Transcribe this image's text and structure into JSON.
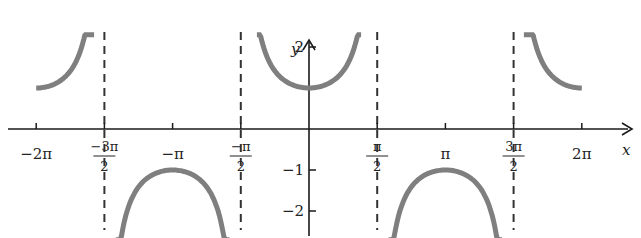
{
  "chart_data": {
    "type": "line",
    "title": "",
    "function": "y = sec x",
    "xlabel": "x",
    "ylabel": "y",
    "xlim": [
      -6.6,
      6.9
    ],
    "ylim": [
      -2.6,
      2.0
    ],
    "grid": false,
    "legend": null,
    "x_ticks": [
      {
        "value": -6.2832,
        "label": "−2π"
      },
      {
        "value": -4.7124,
        "label": "−3π/2",
        "num": "−3π",
        "den": "2"
      },
      {
        "value": -3.1416,
        "label": "−π"
      },
      {
        "value": -1.5708,
        "label": "−π/2",
        "num": "−π",
        "den": "2"
      },
      {
        "value": 1.5708,
        "label": "π/2",
        "num": "π",
        "den": "2"
      },
      {
        "value": 3.1416,
        "label": "π"
      },
      {
        "value": 4.7124,
        "label": "3π/2",
        "num": "3π",
        "den": "2"
      },
      {
        "value": 6.2832,
        "label": "2π"
      }
    ],
    "y_ticks": [
      {
        "value": 2,
        "label": "2"
      },
      {
        "value": -1,
        "label": "−1"
      },
      {
        "value": -2,
        "label": "−2"
      }
    ],
    "asymptotes": [
      -4.7124,
      -1.5708,
      1.5708,
      4.7124
    ],
    "series": [
      {
        "name": "sec x branch 1",
        "x_range": [
          -6.2832,
          -4.95
        ],
        "points": [
          [
            -6.2832,
            1
          ],
          [
            -5.5,
            1.41
          ],
          [
            -5.2,
            2.1
          ],
          [
            -4.95,
            4.2
          ]
        ]
      },
      {
        "name": "sec x branch 2",
        "x_range": [
          -4.45,
          -1.83
        ],
        "points": [
          [
            -4.45,
            -3.9
          ],
          [
            -4.0,
            -1.53
          ],
          [
            -3.1416,
            -1
          ],
          [
            -2.28,
            -1.53
          ],
          [
            -1.83,
            -3.9
          ]
        ]
      },
      {
        "name": "sec x branch 3",
        "x_range": [
          -1.2,
          1.2
        ],
        "points": [
          [
            -1.2,
            2.76
          ],
          [
            -0.8,
            1.44
          ],
          [
            0,
            1
          ],
          [
            0.8,
            1.44
          ],
          [
            1.2,
            2.76
          ]
        ]
      },
      {
        "name": "sec x branch 4",
        "x_range": [
          1.83,
          4.45
        ],
        "points": [
          [
            1.83,
            -3.9
          ],
          [
            2.28,
            -1.53
          ],
          [
            3.1416,
            -1
          ],
          [
            4.0,
            -1.53
          ],
          [
            4.45,
            -3.9
          ]
        ]
      },
      {
        "name": "sec x branch 5",
        "x_range": [
          4.95,
          6.2832
        ],
        "points": [
          [
            4.95,
            4.2
          ],
          [
            5.2,
            2.1
          ],
          [
            5.5,
            1.41
          ],
          [
            6.2832,
            1
          ]
        ]
      }
    ],
    "colors": {
      "curve": "#7f7f7f",
      "axes": "#1a1a1a",
      "asymptote": "#333333"
    }
  }
}
